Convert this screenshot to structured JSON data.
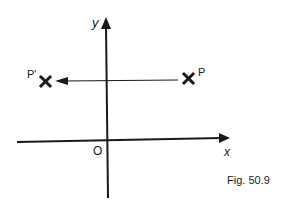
{
  "diagram": {
    "type": "coordinate-reflection",
    "axes": {
      "x_label": "x",
      "y_label": "y",
      "origin_label": "O"
    },
    "points": [
      {
        "label": "P",
        "marker": "cross"
      },
      {
        "label": "P'",
        "marker": "cross"
      }
    ],
    "arrow": {
      "from": "P",
      "to": "P'",
      "direction": "left"
    },
    "caption": "Fig. 50.9",
    "colors": {
      "ink": "#1a1a1a",
      "background": "#ffffff"
    }
  }
}
